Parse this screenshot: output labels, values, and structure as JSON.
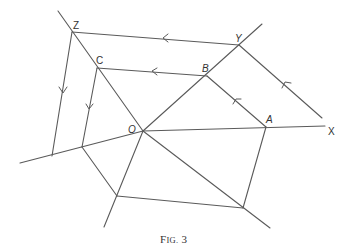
{
  "figure": {
    "caption": "Fig. 3",
    "caption_display": {
      "F": "F",
      "IG": "IG.",
      "num": "3"
    },
    "labels": {
      "Z": "Z",
      "Y": "Y",
      "C": "C",
      "B": "B",
      "O": "O",
      "A": "A",
      "X": "X"
    },
    "points": {
      "O": [
        143,
        131
      ],
      "Z": [
        72,
        32
      ],
      "C": [
        97,
        68
      ],
      "Y": [
        239,
        45
      ],
      "B": [
        207,
        76
      ],
      "A": [
        266,
        127
      ],
      "X": [
        325,
        126
      ],
      "P1": [
        52,
        156
      ],
      "P2": [
        82,
        147
      ],
      "P3": [
        117,
        196
      ],
      "P4": [
        243,
        208
      ]
    },
    "arrows": [
      {
        "segment": "Y-Z",
        "direction": "toward Z"
      },
      {
        "segment": "B-C",
        "direction": "toward C"
      },
      {
        "segment": "A-B",
        "direction": "toward B"
      },
      {
        "segment": "Y-lower-right",
        "direction": "toward Y"
      },
      {
        "segment": "Z-P1",
        "direction": "downward"
      },
      {
        "segment": "C-P2",
        "direction": "downward"
      }
    ]
  }
}
